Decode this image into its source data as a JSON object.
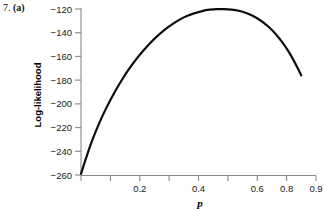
{
  "figure": {
    "problem_number": "7.",
    "part_label": "(a)"
  },
  "chart_data": {
    "type": "line",
    "title": "",
    "subtitle": "",
    "xlabel": "p",
    "ylabel": "Log-likelihood",
    "xlim": [
      0.1,
      0.9
    ],
    "ylim": [
      -260,
      -120
    ],
    "grid": false,
    "legend": null,
    "x_ticks": [
      0.2,
      0.4,
      0.6,
      0.8,
      0.9
    ],
    "x_tick_labels": [
      "0.2",
      "0.4",
      "0.6",
      "0.8",
      "0.9"
    ],
    "x_minor_ticks": [
      0.1,
      0.3,
      0.5,
      0.7
    ],
    "y_ticks": [
      -120,
      -140,
      -160,
      -180,
      -200,
      -220,
      -240,
      -260
    ],
    "y_tick_labels": [
      "−120",
      "−140",
      "−160",
      "−180",
      "−200",
      "−220",
      "−240",
      "−260"
    ],
    "series": [
      {
        "name": "log-likelihood",
        "color": "#0d0d0d",
        "x": [
          0.1,
          0.125,
          0.15,
          0.175,
          0.2,
          0.225,
          0.25,
          0.275,
          0.3,
          0.325,
          0.35,
          0.375,
          0.4,
          0.425,
          0.45,
          0.475,
          0.5,
          0.525,
          0.55,
          0.575,
          0.6,
          0.625,
          0.65,
          0.675,
          0.7,
          0.725,
          0.75,
          0.775,
          0.8,
          0.825,
          0.85
        ],
        "y": [
          -259.0,
          -239.5,
          -223.0,
          -209.0,
          -196.5,
          -185.5,
          -175.5,
          -166.5,
          -158.5,
          -151.5,
          -145.0,
          -139.5,
          -134.5,
          -130.5,
          -127.0,
          -124.5,
          -122.5,
          -121.0,
          -120.2,
          -120.0,
          -120.2,
          -120.8,
          -122.2,
          -124.5,
          -127.8,
          -132.0,
          -137.5,
          -144.5,
          -153.0,
          -163.5,
          -176.0
        ]
      }
    ],
    "annotations": [],
    "peak": {
      "x": 0.58,
      "y": -120.0
    }
  }
}
